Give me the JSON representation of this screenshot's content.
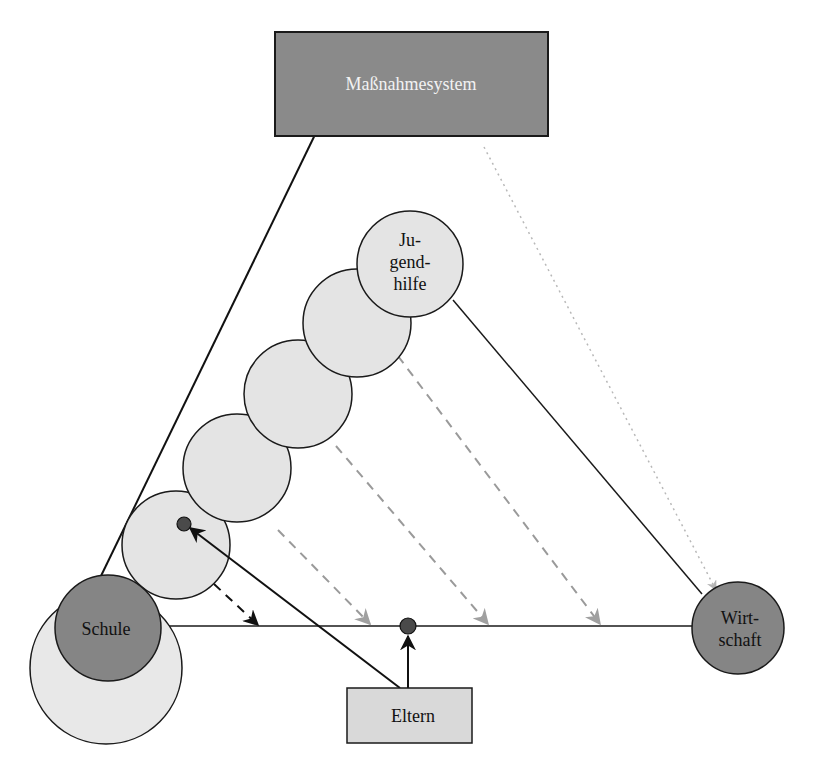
{
  "nodes": {
    "massnahmesystem": {
      "label": "Maßnahmesystem",
      "shape": "rectangle",
      "fill": "#8a8a8a",
      "text_color": "#f2f2f2"
    },
    "jugendhilfe": {
      "label_lines": [
        "Ju-",
        "gend-",
        "hilfe"
      ],
      "shape": "circle",
      "fill": "#e4e4e4"
    },
    "schule": {
      "label": "Schule",
      "shape": "circle",
      "fill": "#858585",
      "outer_fill": "#e8e8e8"
    },
    "wirtschaft": {
      "label_lines": [
        "Wirt-",
        "schaft"
      ],
      "shape": "circle",
      "fill": "#858585"
    },
    "eltern": {
      "label": "Eltern",
      "shape": "rectangle",
      "fill": "#d9d9d9"
    },
    "transition_circles": {
      "count": 4,
      "fill": "#e4e4e4"
    }
  },
  "edges": [
    {
      "from": "schule",
      "to": "massnahmesystem",
      "style": "solid",
      "arrow": true
    },
    {
      "from": "jugendhilfe",
      "to": "wirtschaft",
      "style": "solid",
      "arrow": false
    },
    {
      "from": "schule",
      "to": "wirtschaft",
      "style": "solid",
      "arrow": false
    },
    {
      "from": "massnahmesystem",
      "to": "wirtschaft",
      "style": "dotted-gray",
      "arrow": true
    },
    {
      "from": "eltern",
      "to": "transition_circle_1",
      "style": "solid",
      "arrow": true
    },
    {
      "from": "eltern",
      "to": "schule-wirtschaft-line",
      "style": "solid",
      "arrow": true
    },
    {
      "from": "transition_circle_1",
      "to": "schule-wirtschaft-line",
      "style": "dashed-black",
      "arrow": true
    },
    {
      "from": "transition_circle_2",
      "to": "schule-wirtschaft-line",
      "style": "dashed-gray",
      "arrow": true
    },
    {
      "from": "transition_circle_3",
      "to": "schule-wirtschaft-line",
      "style": "dashed-gray",
      "arrow": true
    },
    {
      "from": "transition_circle_4",
      "to": "schule-wirtschaft-line",
      "style": "dashed-gray",
      "arrow": true
    }
  ],
  "colors": {
    "dark_fill": "#858585",
    "light_fill": "#e4e4e4",
    "stroke": "#1a1a1a",
    "dashed_gray": "#9a9a9a"
  }
}
